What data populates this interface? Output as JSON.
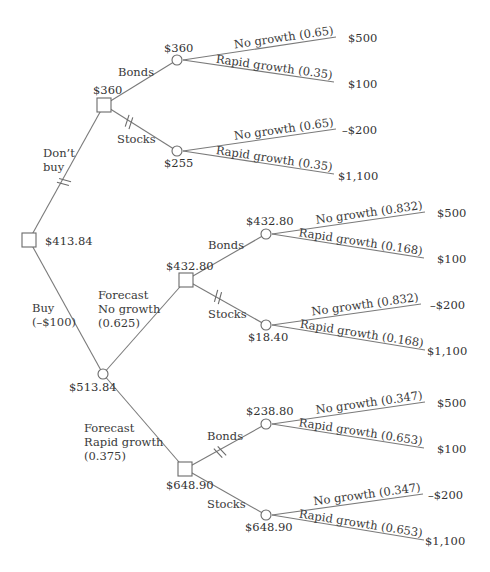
{
  "diagram": {
    "type": "decision-tree",
    "root": {
      "id": "root",
      "kind": "decision",
      "value": "$413.84",
      "x": 29,
      "y": 240
    },
    "nodes": [
      {
        "id": "dontbuy",
        "kind": "decision",
        "value": "$360",
        "x": 104,
        "y": 105,
        "value_pos": [
          93,
          94
        ]
      },
      {
        "id": "dontbuy-bonds",
        "kind": "chance",
        "value": "$360",
        "x": 177,
        "y": 60,
        "value_pos": [
          164,
          52
        ]
      },
      {
        "id": "dontbuy-stocks",
        "kind": "chance",
        "value": "$255",
        "x": 177,
        "y": 151,
        "value_pos": [
          164,
          167
        ]
      },
      {
        "id": "buy",
        "kind": "chance",
        "value": "$513.84",
        "x": 103,
        "y": 374,
        "value_pos": [
          69,
          391
        ]
      },
      {
        "id": "fc-nogrowth",
        "kind": "decision",
        "value": "$432.80",
        "x": 186,
        "y": 280,
        "value_pos": [
          166,
          270
        ]
      },
      {
        "id": "fcng-bonds",
        "kind": "chance",
        "value": "$432.80",
        "x": 266,
        "y": 234,
        "value_pos": [
          246,
          225
        ]
      },
      {
        "id": "fcng-stocks",
        "kind": "chance",
        "value": "$18.40",
        "x": 266,
        "y": 325,
        "value_pos": [
          248,
          341
        ]
      },
      {
        "id": "fc-rapid",
        "kind": "decision",
        "value": "$648.90",
        "x": 185,
        "y": 469,
        "value_pos": [
          166,
          489
        ]
      },
      {
        "id": "fcrg-bonds",
        "kind": "chance",
        "value": "$238.80",
        "x": 266,
        "y": 424,
        "value_pos": [
          246,
          415
        ]
      },
      {
        "id": "fcrg-stocks",
        "kind": "chance",
        "value": "$648.90",
        "x": 266,
        "y": 515,
        "value_pos": [
          245,
          531
        ]
      }
    ],
    "edges": [
      {
        "from": "root",
        "to": "dontbuy",
        "label": [
          "Don’t",
          "buy"
        ],
        "label_pos": [
          43,
          157
        ],
        "pruned": true,
        "hash_at": [
          64,
          182
        ]
      },
      {
        "from": "root",
        "to": "buy",
        "label": [
          "Buy",
          "(–$100)"
        ],
        "label_pos": [
          32,
          312
        ],
        "pruned": false
      },
      {
        "from": "dontbuy",
        "to": "dontbuy-bonds",
        "label": [
          "Bonds"
        ],
        "label_pos": [
          118,
          76
        ],
        "pruned": false
      },
      {
        "from": "dontbuy",
        "to": "dontbuy-stocks",
        "label": [
          "Stocks"
        ],
        "label_pos": [
          117,
          143
        ],
        "pruned": true,
        "hash_at": [
          129,
          122
        ]
      },
      {
        "from": "buy",
        "to": "fc-nogrowth",
        "label": [
          "Forecast",
          "No growth",
          "(0.625)"
        ],
        "label_pos": [
          98,
          299
        ],
        "pruned": false
      },
      {
        "from": "buy",
        "to": "fc-rapid",
        "label": [
          "Forecast",
          "Rapid growth",
          "(0.375)"
        ],
        "label_pos": [
          84,
          432
        ],
        "pruned": false
      },
      {
        "from": "fc-nogrowth",
        "to": "fcng-bonds",
        "label": [
          "Bonds"
        ],
        "label_pos": [
          208,
          249
        ],
        "pruned": false
      },
      {
        "from": "fc-nogrowth",
        "to": "fcng-stocks",
        "label": [
          "Stocks"
        ],
        "label_pos": [
          208,
          318
        ],
        "pruned": true,
        "hash_at": [
          218,
          297
        ]
      },
      {
        "from": "fc-rapid",
        "to": "fcrg-bonds",
        "label": [
          "Bonds"
        ],
        "label_pos": [
          207,
          440
        ],
        "pruned": true,
        "hash_at": [
          220,
          452
        ]
      },
      {
        "from": "fc-rapid",
        "to": "fcrg-stocks",
        "label": [
          "Stocks"
        ],
        "label_pos": [
          207,
          508
        ],
        "pruned": false
      }
    ],
    "outcomes": [
      {
        "from": "dontbuy-bonds",
        "label": "No growth (0.65)",
        "end": [
          336,
          37
        ],
        "payoff": "$500",
        "payoff_pos": [
          348,
          42
        ]
      },
      {
        "from": "dontbuy-bonds",
        "label": "Rapid growth (0.35)",
        "end": [
          334,
          82
        ],
        "payoff": "$100",
        "payoff_pos": [
          348,
          88
        ]
      },
      {
        "from": "dontbuy-stocks",
        "label": "No growth (0.65)",
        "end": [
          336,
          129
        ],
        "payoff": "–$200",
        "payoff_pos": [
          342,
          134
        ]
      },
      {
        "from": "dontbuy-stocks",
        "label": "Rapid growth (0.35)",
        "end": [
          334,
          174
        ],
        "payoff": "$1,100",
        "payoff_pos": [
          338,
          180
        ]
      },
      {
        "from": "fcng-bonds",
        "label": "No growth (0.832)",
        "end": [
          425,
          212
        ],
        "payoff": "$500",
        "payoff_pos": [
          437,
          217
        ]
      },
      {
        "from": "fcng-bonds",
        "label": "Rapid growth (0.168)",
        "end": [
          424,
          258
        ],
        "payoff": "$100",
        "payoff_pos": [
          437,
          263
        ]
      },
      {
        "from": "fcng-stocks",
        "label": "No growth (0.832)",
        "end": [
          421,
          304
        ],
        "payoff": "–$200",
        "payoff_pos": [
          430,
          309
        ]
      },
      {
        "from": "fcng-stocks",
        "label": "Rapid growth (0.168)",
        "end": [
          425,
          350
        ],
        "payoff": "$1,100",
        "payoff_pos": [
          427,
          355
        ]
      },
      {
        "from": "fcrg-bonds",
        "label": "No growth (0.347)",
        "end": [
          425,
          402
        ],
        "payoff": "$500",
        "payoff_pos": [
          437,
          407
        ]
      },
      {
        "from": "fcrg-bonds",
        "label": "Rapid growth (0.653)",
        "end": [
          424,
          448
        ],
        "payoff": "$100",
        "payoff_pos": [
          437,
          453
        ]
      },
      {
        "from": "fcrg-stocks",
        "label": "No growth (0.347)",
        "end": [
          423,
          494
        ],
        "payoff": "–$200",
        "payoff_pos": [
          428,
          499
        ]
      },
      {
        "from": "fcrg-stocks",
        "label": "Rapid growth (0.653)",
        "end": [
          424,
          540
        ],
        "payoff": "$1,100",
        "payoff_pos": [
          425,
          545
        ]
      }
    ]
  }
}
